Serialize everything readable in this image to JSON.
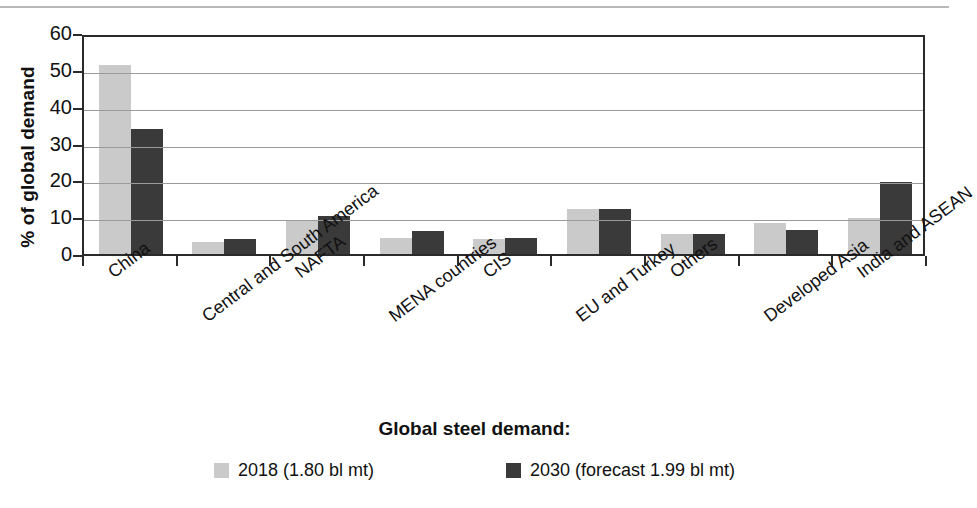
{
  "chart_data": {
    "type": "bar",
    "title": "",
    "xlabel": "",
    "ylabel": "% of global demand",
    "ylim": [
      0,
      60
    ],
    "yticks": [
      0,
      10,
      20,
      30,
      40,
      50,
      60
    ],
    "grid": true,
    "legend_position": "bottom",
    "legend_title": "Global steel demand:",
    "categories": [
      "China",
      "Central and South America",
      "NAFTA",
      "MENA countries",
      "CIS",
      "EU and Turkey",
      "Others",
      "Developed Asia",
      "India and ASEAN"
    ],
    "series": [
      {
        "name": "2018 (1.80 bl mt)",
        "color": "#cacaca",
        "values": [
          51.3,
          3.2,
          9.3,
          4.3,
          4.2,
          12.3,
          5.4,
          8.5,
          9.7
        ]
      },
      {
        "name": "2030 (forecast 1.99 bl mt)",
        "color": "#3a3a3a",
        "values": [
          34.0,
          4.2,
          10.3,
          6.2,
          4.3,
          12.3,
          5.4,
          6.5,
          19.5
        ]
      }
    ]
  },
  "legend": {
    "title": "Global steel demand:",
    "items": [
      {
        "label": "2018 (1.80 bl mt)",
        "swatch": "light-gray-swatch"
      },
      {
        "label": "2030 (forecast 1.99 bl mt)",
        "swatch": "dark-gray-swatch"
      }
    ]
  },
  "axes": {
    "y_title": "% of global demand",
    "y_tick_labels": [
      "60",
      "50",
      "40",
      "30",
      "20",
      "10",
      "0"
    ],
    "x_tick_labels": [
      "China",
      "Central and South America",
      "NAFTA",
      "MENA countries",
      "CIS",
      "EU and Turkey",
      "Others",
      "Developed Asia",
      "India and ASEAN"
    ]
  },
  "colors": {
    "series_2018": "#cacaca",
    "series_2030": "#3a3a3a",
    "axis": "#2a2a2a",
    "gridline": "#9a9a9a",
    "page_rule": "#b9b9b9",
    "background": "#ffffff"
  }
}
